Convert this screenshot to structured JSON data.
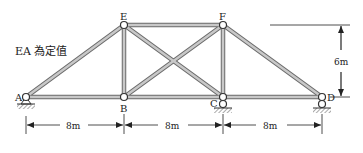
{
  "diagram": {
    "type": "truss",
    "note": "EA 為定值",
    "nodes": [
      {
        "id": "A",
        "label": "A",
        "x": 26,
        "y": 97,
        "support": "pin"
      },
      {
        "id": "B",
        "label": "B",
        "x": 124,
        "y": 97
      },
      {
        "id": "C",
        "label": "C",
        "x": 223,
        "y": 97,
        "support": "roller"
      },
      {
        "id": "D",
        "label": "D",
        "x": 322,
        "y": 97,
        "support": "roller"
      },
      {
        "id": "E",
        "label": "E",
        "x": 124,
        "y": 25
      },
      {
        "id": "F",
        "label": "F",
        "x": 223,
        "y": 25
      }
    ],
    "members": [
      [
        "A",
        "B"
      ],
      [
        "B",
        "C"
      ],
      [
        "C",
        "D"
      ],
      [
        "E",
        "F"
      ],
      [
        "A",
        "E"
      ],
      [
        "E",
        "B"
      ],
      [
        "F",
        "C"
      ],
      [
        "F",
        "D"
      ],
      [
        "E",
        "C"
      ],
      [
        "B",
        "F"
      ]
    ],
    "dimensions": {
      "spans": [
        "8m",
        "8m",
        "8m"
      ],
      "height": "6m"
    },
    "colors": {
      "member_fill": "#c8c8c8",
      "member_edge": "#6a6a6a",
      "line": "#222222"
    }
  }
}
